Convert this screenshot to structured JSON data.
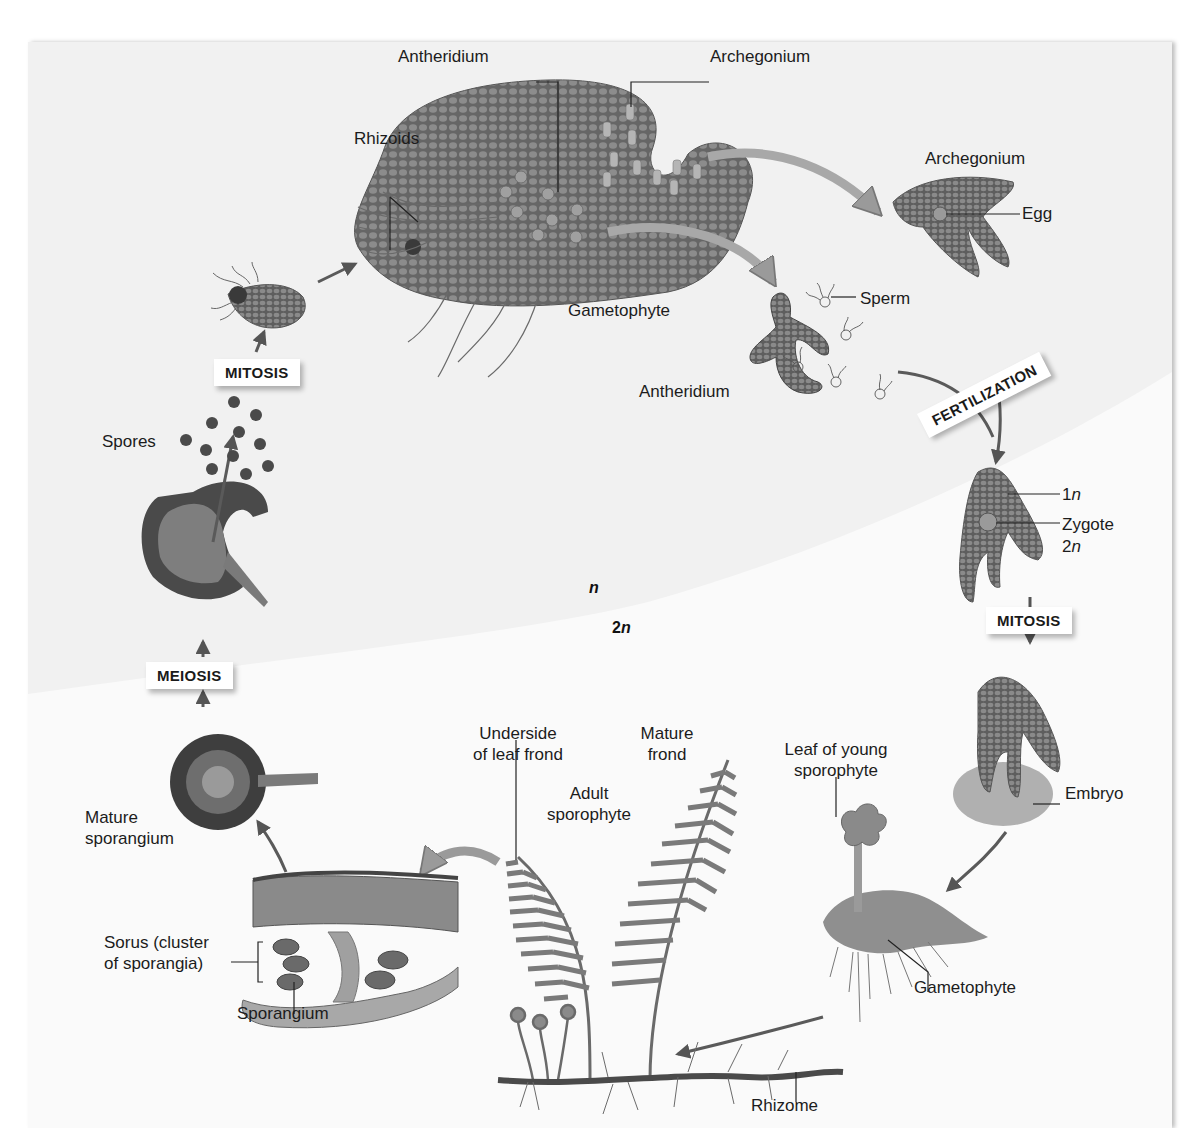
{
  "figure": {
    "regions": {
      "haploid": "n",
      "diploid_prefix": "2",
      "diploid_suffix": "n"
    },
    "stages": {
      "mitosis_top": "MITOSIS",
      "fertilization": "FERTILIZATION",
      "mitosis_right": "MITOSIS",
      "meiosis": "MEIOSIS"
    },
    "labels": {
      "antheridium_top": "Antheridium",
      "archegonium_top": "Archegonium",
      "rhizoids": "Rhizoids",
      "gametophyte_top": "Gametophyte",
      "archegonium_detail": "Archegonium",
      "egg": "Egg",
      "sperm": "Sperm",
      "antheridium_detail": "Antheridium",
      "one_n_prefix": "1",
      "one_n_suffix": "n",
      "zygote": "Zygote",
      "two_n_prefix": "2",
      "two_n_suffix": "n",
      "spores": "Spores",
      "embryo": "Embryo",
      "leaf_young_sporophyte_line1": "Leaf of young",
      "leaf_young_sporophyte_line2": "sporophyte",
      "gametophyte_bottom": "Gametophyte",
      "underside_line1": "Underside",
      "underside_line2": "of leaf frond",
      "mature_frond_line1": "Mature",
      "mature_frond_line2": "frond",
      "adult_sporophyte_line1": "Adult",
      "adult_sporophyte_line2": "sporophyte",
      "mature_sporangium_line1": "Mature",
      "mature_sporangium_line2": "sporangium",
      "sorus_line1": "Sorus (cluster",
      "sorus_line2": "of sporangia)",
      "sporangium": "Sporangium",
      "rhizome": "Rhizome"
    },
    "colors": {
      "panel_bg": "#f1f1f1",
      "diploid_bg": "#fafafa",
      "tissue": "#6e6e6e",
      "tissue_dark": "#4a4a4a",
      "arrow": "#7a7a7a",
      "arrow_dark": "#555555"
    }
  }
}
